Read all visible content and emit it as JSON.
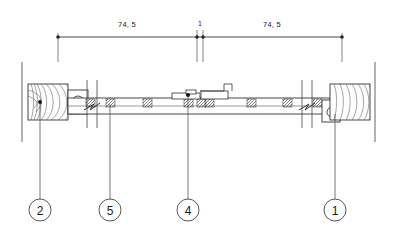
{
  "drawing": {
    "type": "cad-section-elevation",
    "units_note": "",
    "line_color": "#333333",
    "hatch_color": "#555555",
    "text_color": "#1a1a1a",
    "background": "#ffffff"
  },
  "dimensions": {
    "chain": [
      {
        "id": "dim-left",
        "label": "74, 5",
        "x_start": 58,
        "x_end": 197,
        "text_x": 127,
        "text_y": 20
      },
      {
        "id": "dim-center",
        "label": "1",
        "x_start": 197,
        "x_end": 203,
        "text_x": 200,
        "text_y": 20
      },
      {
        "id": "dim-right",
        "label": "74, 5",
        "x_start": 203,
        "x_end": 342,
        "text_x": 272,
        "text_y": 20
      }
    ],
    "dim_line_y": 37
  },
  "callouts": [
    {
      "id": "callout-2",
      "label": "2",
      "cx": 40,
      "cy": 210,
      "r": 11,
      "leader_x": 40,
      "leader_from_y": 102,
      "leader_to_y": 199
    },
    {
      "id": "callout-5",
      "label": "5",
      "cx": 110,
      "cy": 210,
      "r": 11,
      "leader_x": 110,
      "leader_from_y": 102,
      "leader_to_y": 199
    },
    {
      "id": "callout-4",
      "label": "4",
      "cx": 188,
      "cy": 210,
      "r": 11,
      "leader_x": 188,
      "leader_from_y": 102,
      "leader_to_y": 199
    },
    {
      "id": "callout-1",
      "label": "1",
      "cx": 335,
      "cy": 210,
      "r": 11,
      "leader_x": 335,
      "leader_from_y": 110,
      "leader_to_y": 199
    }
  ],
  "components": {
    "left_wood_block": {
      "x": 28,
      "y": 84,
      "w": 40,
      "h": 36,
      "hatch": "wood-grain"
    },
    "right_wood_block": {
      "x": 330,
      "y": 84,
      "w": 40,
      "h": 36,
      "hatch": "wood-grain"
    },
    "left_fastener": {
      "cx": 78,
      "cy": 102,
      "r": 6
    },
    "right_fastener": {
      "cx": 332,
      "cy": 112,
      "r": 5
    },
    "rail": {
      "x": 68,
      "y": 98,
      "w": 262,
      "h": 16
    },
    "center_bracket": {
      "x": 172,
      "y": 90,
      "w": 56,
      "h": 10
    },
    "break_symbols": [
      {
        "x": 92,
        "y": 104
      },
      {
        "x": 307,
        "y": 104
      }
    ],
    "section_marks_x": [
      75,
      110,
      147,
      188,
      205,
      252,
      288,
      318
    ],
    "reference_lines": [
      {
        "x": 22,
        "y_top": 62,
        "y_bottom": 142
      },
      {
        "x": 375,
        "y_top": 62,
        "y_bottom": 142
      }
    ]
  }
}
